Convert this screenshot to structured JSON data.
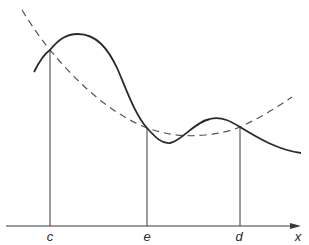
{
  "figure": {
    "type": "function-curve-diagram",
    "axis": {
      "label": "x",
      "y": 226,
      "x_start": 6,
      "x_end": 300,
      "color": "#3a3a3a"
    },
    "points": [
      {
        "label": "c",
        "x": 50,
        "curve_y": 50
      },
      {
        "label": "e",
        "x": 147,
        "curve_y": 128
      },
      {
        "label": "d",
        "x": 240,
        "curve_y": 127
      }
    ],
    "curves": {
      "solid": {
        "name": "function-curve",
        "style": "solid",
        "color": "#2a2a2a",
        "path": "M34,72 C40,60 44,54 50,50 C58,40 66,34 78,34 C96,34 108,48 118,70 C128,94 136,116 147,128 C156,138 162,144 170,143 C182,141 194,122 210,119 C222,116 232,122 240,127 C258,138 278,150 301,153"
      },
      "dashed": {
        "name": "interpolating-curve",
        "style": "dashed",
        "color": "#555555",
        "path": "M22,10 C32,26 40,38 50,50 C80,86 112,114 147,128 C168,135 185,137 205,135 C218,134 230,131 240,127 C258,119 276,108 292,97"
      }
    }
  }
}
